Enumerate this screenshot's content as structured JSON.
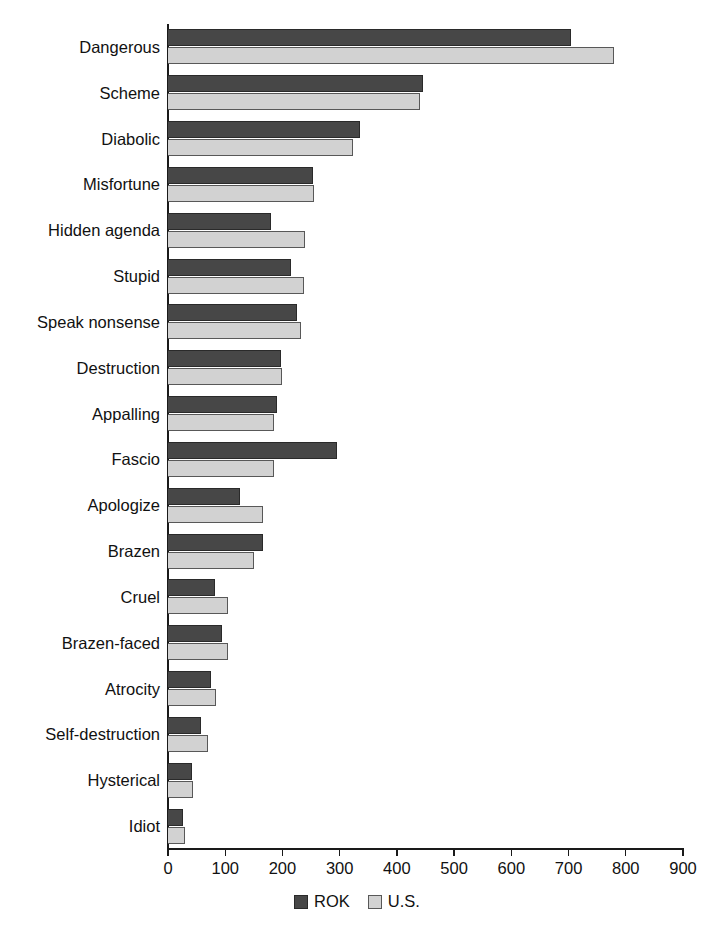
{
  "chart_data": {
    "type": "bar",
    "orientation": "horizontal",
    "title": "",
    "xlabel": "",
    "ylabel": "",
    "xlim": [
      0,
      900
    ],
    "xticks": [
      0,
      100,
      200,
      300,
      400,
      500,
      600,
      700,
      800,
      900
    ],
    "grid": false,
    "legend_position": "bottom-center",
    "categories": [
      "Dangerous",
      "Scheme",
      "Diabolic",
      "Misfortune",
      "Hidden agenda",
      "Stupid",
      "Speak nonsense",
      "Destruction",
      "Appalling",
      "Fascio",
      "Apologize",
      "Brazen",
      "Cruel",
      "Brazen-faced",
      "Atrocity",
      "Self-destruction",
      "Hysterical",
      "Idiot"
    ],
    "series": [
      {
        "name": "ROK",
        "color": "#474747",
        "values": [
          705,
          445,
          335,
          253,
          180,
          215,
          225,
          197,
          191,
          295,
          125,
          166,
          83,
          95,
          75,
          57,
          42,
          26
        ]
      },
      {
        "name": "U.S.",
        "color": "#d2d2d2",
        "values": [
          780,
          441,
          323,
          256,
          240,
          237,
          233,
          200,
          186,
          185,
          166,
          151,
          105,
          104,
          84,
          70,
          44,
          29
        ]
      }
    ]
  },
  "legend": {
    "items": [
      {
        "label": "ROK",
        "swatch": "rok"
      },
      {
        "label": "U.S.",
        "swatch": "us"
      }
    ]
  }
}
